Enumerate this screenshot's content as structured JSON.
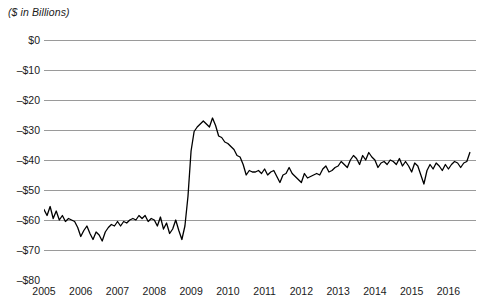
{
  "chart_data": {
    "type": "line",
    "title": "($ in Billions)",
    "xlabel": "",
    "ylabel": "",
    "ylim": [
      -80,
      0
    ],
    "xlim": [
      2005,
      2016.75
    ],
    "grid": true,
    "legend": null,
    "line_color": "#000000",
    "grid_color": "#9a9a9a",
    "ytick_labels": [
      "$0",
      "–$10",
      "–$20",
      "–$30",
      "–$40",
      "–$50",
      "–$60",
      "–$70",
      "–$80"
    ],
    "ytick_values": [
      0,
      -10,
      -20,
      -30,
      -40,
      -50,
      -60,
      -70,
      -80
    ],
    "xtick_labels": [
      "2005",
      "2006",
      "2007",
      "2008",
      "2009",
      "2010",
      "2011",
      "2012",
      "2013",
      "2014",
      "2015",
      "2016"
    ],
    "xtick_values": [
      2005,
      2006,
      2007,
      2008,
      2009,
      2010,
      2011,
      2012,
      2013,
      2014,
      2015,
      2016
    ],
    "series": [
      {
        "name": "Monthly balance",
        "x": [
          2005.0,
          2005.083,
          2005.167,
          2005.25,
          2005.333,
          2005.417,
          2005.5,
          2005.583,
          2005.667,
          2005.75,
          2005.833,
          2005.917,
          2006.0,
          2006.083,
          2006.167,
          2006.25,
          2006.333,
          2006.417,
          2006.5,
          2006.583,
          2006.667,
          2006.75,
          2006.833,
          2006.917,
          2007.0,
          2007.083,
          2007.167,
          2007.25,
          2007.333,
          2007.417,
          2007.5,
          2007.583,
          2007.667,
          2007.75,
          2007.833,
          2007.917,
          2008.0,
          2008.083,
          2008.167,
          2008.25,
          2008.333,
          2008.417,
          2008.5,
          2008.583,
          2008.667,
          2008.75,
          2008.833,
          2008.917,
          2009.0,
          2009.083,
          2009.167,
          2009.25,
          2009.333,
          2009.417,
          2009.5,
          2009.583,
          2009.667,
          2009.75,
          2009.833,
          2009.917,
          2010.0,
          2010.083,
          2010.167,
          2010.25,
          2010.333,
          2010.417,
          2010.5,
          2010.583,
          2010.667,
          2010.75,
          2010.833,
          2010.917,
          2011.0,
          2011.083,
          2011.167,
          2011.25,
          2011.333,
          2011.417,
          2011.5,
          2011.583,
          2011.667,
          2011.75,
          2011.833,
          2011.917,
          2012.0,
          2012.083,
          2012.167,
          2012.25,
          2012.333,
          2012.417,
          2012.5,
          2012.583,
          2012.667,
          2012.75,
          2012.833,
          2012.917,
          2013.0,
          2013.083,
          2013.167,
          2013.25,
          2013.333,
          2013.417,
          2013.5,
          2013.583,
          2013.667,
          2013.75,
          2013.833,
          2013.917,
          2014.0,
          2014.083,
          2014.167,
          2014.25,
          2014.333,
          2014.417,
          2014.5,
          2014.583,
          2014.667,
          2014.75,
          2014.833,
          2014.917,
          2015.0,
          2015.083,
          2015.167,
          2015.25,
          2015.333,
          2015.417,
          2015.5,
          2015.583,
          2015.667,
          2015.75,
          2015.833,
          2015.917,
          2016.0,
          2016.083,
          2016.167,
          2016.25,
          2016.333,
          2016.417,
          2016.5,
          2016.583
        ],
        "values": [
          -56.5,
          -58.5,
          -55.5,
          -59.5,
          -57.0,
          -60.0,
          -58.5,
          -60.5,
          -59.5,
          -60.0,
          -60.5,
          -62.5,
          -65.5,
          -63.5,
          -62.0,
          -64.5,
          -66.5,
          -64.0,
          -65.0,
          -67.0,
          -64.0,
          -62.5,
          -61.5,
          -62.0,
          -60.5,
          -62.0,
          -60.5,
          -61.0,
          -60.0,
          -59.5,
          -60.0,
          -58.5,
          -59.5,
          -58.5,
          -60.5,
          -59.5,
          -60.0,
          -62.0,
          -59.0,
          -63.0,
          -61.0,
          -64.5,
          -63.0,
          -60.0,
          -63.5,
          -66.5,
          -62.0,
          -52.0,
          -37.0,
          -30.5,
          -29.0,
          -28.0,
          -27.0,
          -28.0,
          -29.0,
          -26.0,
          -28.5,
          -32.0,
          -32.5,
          -34.0,
          -34.5,
          -35.5,
          -36.5,
          -38.5,
          -39.0,
          -41.5,
          -45.0,
          -43.5,
          -44.0,
          -44.0,
          -43.5,
          -44.5,
          -43.0,
          -45.0,
          -44.0,
          -43.5,
          -45.5,
          -47.5,
          -45.0,
          -44.5,
          -42.5,
          -44.5,
          -45.5,
          -46.5,
          -47.5,
          -44.5,
          -46.0,
          -45.5,
          -45.0,
          -44.5,
          -45.0,
          -43.0,
          -42.0,
          -44.0,
          -43.5,
          -42.5,
          -42.0,
          -40.5,
          -41.5,
          -42.5,
          -40.0,
          -38.5,
          -39.5,
          -41.5,
          -38.5,
          -40.0,
          -37.5,
          -39.0,
          -40.0,
          -42.5,
          -41.0,
          -40.5,
          -41.5,
          -40.0,
          -40.5,
          -41.5,
          -39.5,
          -42.0,
          -40.5,
          -42.0,
          -44.0,
          -41.0,
          -42.0,
          -45.0,
          -48.0,
          -43.5,
          -41.5,
          -43.0,
          -41.0,
          -42.0,
          -43.5,
          -41.5,
          -43.0,
          -41.5,
          -40.5,
          -41.0,
          -42.5,
          -41.0,
          -40.5,
          -37.5
        ]
      }
    ]
  }
}
